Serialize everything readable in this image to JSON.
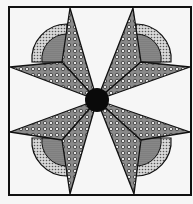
{
  "figure": {
    "title": "",
    "colors": {
      "background": "#f6f6f6",
      "outline": "#111111",
      "center": "#0a0a0a",
      "fan_outer": "#bdbdbd",
      "fan_inner": "#8a8a8a",
      "kite_fill": "#a8a8a8"
    },
    "center": {
      "x": 97,
      "y": 100
    },
    "border": {
      "x": 9,
      "y": 7,
      "width": 182,
      "height": 188
    }
  }
}
